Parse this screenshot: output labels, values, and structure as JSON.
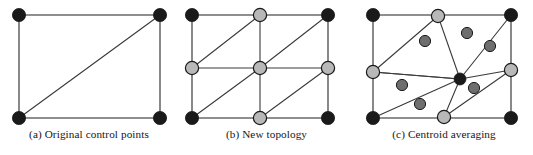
{
  "figure": {
    "panels": [
      {
        "id": "a",
        "caption": "(a) Original control points",
        "width": 178,
        "rect": {
          "x": 19,
          "y": 15,
          "w": 141,
          "h": 103
        },
        "control_points": [
          {
            "name": "corner-top-left",
            "x": 19,
            "y": 15,
            "type": "black",
            "r": 6.6
          },
          {
            "name": "corner-top-right",
            "x": 160,
            "y": 15,
            "type": "black",
            "r": 6.6
          },
          {
            "name": "corner-bottom-left",
            "x": 19,
            "y": 118,
            "type": "black",
            "r": 6.6
          },
          {
            "name": "corner-bottom-right",
            "x": 160,
            "y": 118,
            "type": "black",
            "r": 6.6
          }
        ],
        "edges": [
          {
            "name": "edge-top",
            "x1": 19,
            "y1": 15,
            "x2": 160,
            "y2": 15
          },
          {
            "name": "edge-left",
            "x1": 19,
            "y1": 15,
            "x2": 19,
            "y2": 118
          },
          {
            "name": "edge-right",
            "x1": 160,
            "y1": 15,
            "x2": 160,
            "y2": 118
          },
          {
            "name": "edge-bottom",
            "x1": 19,
            "y1": 118,
            "x2": 160,
            "y2": 118
          },
          {
            "name": "edge-diagonal",
            "x1": 19,
            "y1": 118,
            "x2": 160,
            "y2": 15
          }
        ]
      },
      {
        "id": "b",
        "caption": "(b) New topology",
        "width": 177,
        "rect": {
          "x": 14,
          "y": 15,
          "w": 136,
          "h": 103
        },
        "control_points": [
          {
            "name": "corner-top-left",
            "x": 14,
            "y": 15,
            "type": "black",
            "r": 6.6
          },
          {
            "name": "corner-top-right",
            "x": 150,
            "y": 15,
            "type": "black",
            "r": 6.6
          },
          {
            "name": "corner-bottom-left",
            "x": 14,
            "y": 118,
            "type": "black",
            "r": 6.6
          },
          {
            "name": "corner-bottom-right",
            "x": 150,
            "y": 118,
            "type": "black",
            "r": 6.6
          },
          {
            "name": "edge-midpoint-top",
            "x": 82,
            "y": 15,
            "type": "gray",
            "r": 6.6
          },
          {
            "name": "edge-midpoint-left",
            "x": 14,
            "y": 68,
            "type": "gray",
            "r": 6.6
          },
          {
            "name": "edge-midpoint-right",
            "x": 150,
            "y": 68,
            "type": "gray",
            "r": 6.6
          },
          {
            "name": "edge-midpoint-bottom",
            "x": 82,
            "y": 118,
            "type": "gray",
            "r": 6.6
          },
          {
            "name": "face-center",
            "x": 82,
            "y": 68,
            "type": "gray",
            "r": 6.6
          }
        ],
        "edges": [
          {
            "name": "edge-top",
            "x1": 14,
            "y1": 15,
            "x2": 150,
            "y2": 15
          },
          {
            "name": "edge-bottom",
            "x1": 14,
            "y1": 118,
            "x2": 150,
            "y2": 118
          },
          {
            "name": "edge-left",
            "x1": 14,
            "y1": 15,
            "x2": 14,
            "y2": 118
          },
          {
            "name": "edge-right",
            "x1": 150,
            "y1": 15,
            "x2": 150,
            "y2": 118
          },
          {
            "name": "edge-horizontal-mid",
            "x1": 14,
            "y1": 68,
            "x2": 150,
            "y2": 68
          },
          {
            "name": "edge-vertical-mid",
            "x1": 82,
            "y1": 15,
            "x2": 82,
            "y2": 118
          },
          {
            "name": "edge-diagonal-top-left",
            "x1": 14,
            "y1": 68,
            "x2": 82,
            "y2": 15
          },
          {
            "name": "edge-diagonal-top-right",
            "x1": 82,
            "y1": 68,
            "x2": 150,
            "y2": 15
          },
          {
            "name": "edge-diagonal-bottom-left",
            "x1": 14,
            "y1": 118,
            "x2": 82,
            "y2": 68
          },
          {
            "name": "edge-diagonal-bottom-right",
            "x1": 82,
            "y1": 118,
            "x2": 150,
            "y2": 68
          }
        ]
      },
      {
        "id": "c",
        "caption": "(c) Centroid averaging",
        "width": 178,
        "rect": {
          "x": 18,
          "y": 15,
          "w": 138,
          "h": 103
        },
        "control_points": [
          {
            "name": "corner-top-left",
            "x": 18,
            "y": 15,
            "type": "black",
            "r": 6.6
          },
          {
            "name": "corner-top-right",
            "x": 156,
            "y": 15,
            "type": "black",
            "r": 6.6
          },
          {
            "name": "corner-bottom-left",
            "x": 18,
            "y": 118,
            "type": "black",
            "r": 6.6
          },
          {
            "name": "corner-bottom-right",
            "x": 156,
            "y": 118,
            "type": "black",
            "r": 6.6
          },
          {
            "name": "edge-point-top",
            "x": 83,
            "y": 16,
            "type": "gray",
            "r": 6.6
          },
          {
            "name": "edge-point-left",
            "x": 18,
            "y": 72,
            "type": "gray",
            "r": 6.6
          },
          {
            "name": "edge-point-right",
            "x": 156,
            "y": 70,
            "type": "gray",
            "r": 6.6
          },
          {
            "name": "edge-point-bottom",
            "x": 89,
            "y": 117,
            "type": "gray",
            "r": 6.6
          },
          {
            "name": "averaged-center",
            "x": 105,
            "y": 79,
            "type": "black",
            "r": 6.0
          }
        ],
        "edges": [
          {
            "name": "edge-top",
            "x1": 18,
            "y1": 15,
            "x2": 156,
            "y2": 15
          },
          {
            "name": "edge-bottom",
            "x1": 18,
            "y1": 118,
            "x2": 156,
            "y2": 118
          },
          {
            "name": "edge-left",
            "x1": 18,
            "y1": 15,
            "x2": 18,
            "y2": 118
          },
          {
            "name": "edge-right",
            "x1": 156,
            "y1": 15,
            "x2": 156,
            "y2": 118
          },
          {
            "name": "edge-center-to-left",
            "x1": 105,
            "y1": 79,
            "x2": 18,
            "y2": 72
          },
          {
            "name": "edge-center-to-right",
            "x1": 105,
            "y1": 79,
            "x2": 156,
            "y2": 70
          },
          {
            "name": "edge-center-to-top",
            "x1": 105,
            "y1": 79,
            "x2": 83,
            "y2": 16
          },
          {
            "name": "edge-center-to-bottom",
            "x1": 105,
            "y1": 79,
            "x2": 89,
            "y2": 117
          },
          {
            "name": "edge-center-to-corner-top-left",
            "x1": 105,
            "y1": 79,
            "x2": 18,
            "y2": 72
          },
          {
            "name": "edge-topleft-diagonal",
            "x1": 18,
            "y1": 72,
            "x2": 83,
            "y2": 16
          },
          {
            "name": "edge-topright-diagonal",
            "x1": 105,
            "y1": 79,
            "x2": 156,
            "y2": 15
          },
          {
            "name": "edge-bottomleft-diagonal",
            "x1": 18,
            "y1": 118,
            "x2": 105,
            "y2": 79
          },
          {
            "name": "edge-bottomright-diagonal",
            "x1": 89,
            "y1": 117,
            "x2": 156,
            "y2": 70
          }
        ],
        "centroids": [
          {
            "name": "centroid-dot-1",
            "x": 70,
            "y": 41,
            "r": 5.6
          },
          {
            "name": "centroid-dot-2",
            "x": 112,
            "y": 33,
            "r": 5.6
          },
          {
            "name": "centroid-dot-3",
            "x": 135,
            "y": 46,
            "r": 5.6
          },
          {
            "name": "centroid-dot-4",
            "x": 47,
            "y": 85,
            "r": 5.6
          },
          {
            "name": "centroid-dot-5",
            "x": 65,
            "y": 104,
            "r": 5.6
          },
          {
            "name": "centroid-dot-6",
            "x": 119,
            "y": 88,
            "r": 5.6
          }
        ]
      }
    ]
  },
  "style": {
    "node_black_fill": "#1a1a1a",
    "node_gray_fill": "#b8b8b8",
    "centroid_fill": "#6e6e6e",
    "node_stroke": "#1a1a1a",
    "edge_color": "#3a3a3a",
    "outline_color": "#6b6b6b",
    "background": "#ffffff"
  }
}
